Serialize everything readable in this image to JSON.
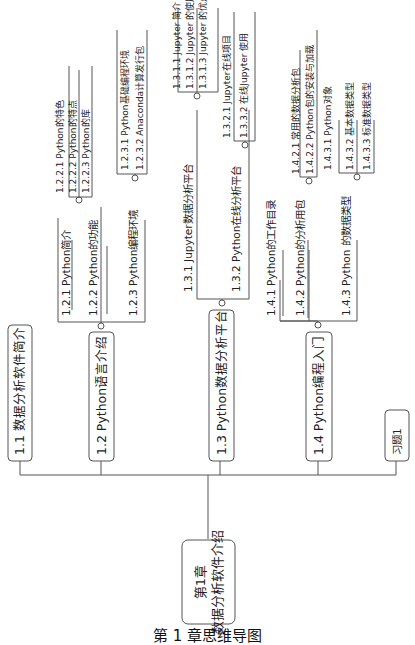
{
  "diagram": {
    "type": "mind-map",
    "orientation": "rotated-90-ccw",
    "root": {
      "line1": "第1章",
      "line2": "数据分析软件介绍"
    },
    "branches": [
      {
        "label": "1.1  数据分析软件简介"
      },
      {
        "label": "1.2  Python语言介绍",
        "children": [
          {
            "label": "1.2.1  Python简介"
          },
          {
            "label": "1.2.2  Python的功能",
            "children": [
              {
                "label": "1.2.2.1  Python的特色"
              },
              {
                "label": "1.2.2.2  Python的特点"
              },
              {
                "label": "1.2.2.3  Python的库"
              }
            ]
          },
          {
            "label": "1.2.3  Python编程环境",
            "children": [
              {
                "label": "1.2.3.1  Python基础编程环境"
              },
              {
                "label": "1.2.3.2  Anaconda计算发行包"
              }
            ]
          }
        ]
      },
      {
        "label": "1.3  Python数据分析平台",
        "children": [
          {
            "label": "1.3.1  Jupyter数据分析平台",
            "children": [
              {
                "label": "1.3.1.1  Jupyter 简介"
              },
              {
                "label": "1.3.1.2  Jupyter 的使用"
              },
              {
                "label": "1.3.1.3  Jupyter 的优点"
              }
            ]
          },
          {
            "label": "1.3.2  Python在线分析平台",
            "children": [
              {
                "label": "1.3.2.1  Jupyter在线项目"
              },
              {
                "label": "1.3.3.2  在线Jupyter 使用"
              }
            ]
          }
        ]
      },
      {
        "label": "1.4  Python编程入门",
        "children": [
          {
            "label": "1.4.1  Python的工作目录"
          },
          {
            "label": "1.4.2  Python的分析用包",
            "children": [
              {
                "label": "1.4.2.1  常用的数据分析包"
              },
              {
                "label": "1.4.2.2  Python包的安装与加载"
              }
            ]
          },
          {
            "label": "1.4.3  Python 的数据类型",
            "children": [
              {
                "label": "1.4.3.1  Python对象"
              },
              {
                "label": "1.4.3.2  基本数据类型"
              },
              {
                "label": "1.4.3.3  标准数据类型"
              }
            ]
          }
        ]
      },
      {
        "label": "习题1"
      }
    ]
  },
  "caption": "第 1 章思维导图"
}
